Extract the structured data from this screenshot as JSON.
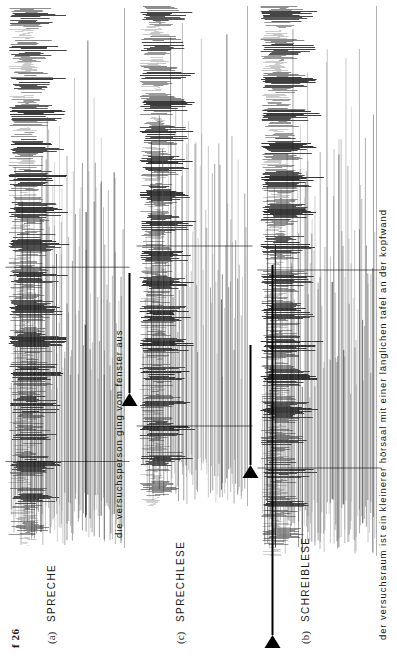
{
  "figure": {
    "label": "f 26",
    "width": 397,
    "height": 656
  },
  "panels": [
    {
      "tag": "(a)",
      "title": "SPRECHE",
      "caption": "die versuchsperson ging vom fenster aus",
      "marker": {
        "present": true,
        "glyph": "right-triangle"
      }
    },
    {
      "tag": "(c)",
      "title": "SPRECHLESE",
      "caption": "",
      "marker": {
        "present": true,
        "glyph": "right-triangle"
      }
    },
    {
      "tag": "(b)",
      "title": "SCHREIBLESE",
      "caption": "der versuchsraum ist ein kleinerer hörsaal mit einer länglichen tafel an der kopfwand",
      "marker": {
        "present": true,
        "glyph": "right-triangle"
      }
    }
  ],
  "colors": {
    "ink": "#000000",
    "paper": "#ffffff",
    "trace_dark": "#1b1b1b",
    "trace_mid": "#555555",
    "trace_light": "#9a9a9a"
  },
  "chart_data": {
    "type": "line",
    "title": "f 26",
    "xlabel": "",
    "ylabel": "",
    "grid": false,
    "legend": "none",
    "series": [
      {
        "name": "SPRECHE",
        "panel": "(a)",
        "annotation": "die versuchsperson ging vom fenster aus",
        "x": [
          0,
          1,
          2,
          3,
          4,
          5,
          6,
          7,
          8,
          9,
          10,
          11,
          12,
          13,
          14,
          15,
          16,
          17,
          18,
          19,
          20,
          21,
          22,
          23,
          24,
          25,
          26,
          27,
          28,
          29,
          30,
          31,
          32,
          33,
          34,
          35,
          36,
          37,
          38,
          39,
          40,
          41,
          42,
          43,
          44,
          45,
          46,
          47,
          48,
          49,
          50,
          51,
          52,
          53,
          54,
          55,
          56,
          57,
          58,
          59,
          60,
          61,
          62,
          63,
          64,
          65,
          66,
          67,
          68,
          69,
          70,
          71,
          72,
          73,
          74,
          75,
          76,
          77,
          78,
          79,
          80,
          81,
          82,
          83,
          84,
          85,
          86,
          87,
          88,
          89,
          90,
          91,
          92,
          93,
          94,
          95,
          96,
          97,
          98,
          99
        ],
        "values": [
          12,
          30,
          64,
          88,
          72,
          40,
          22,
          55,
          95,
          120,
          86,
          48,
          28,
          62,
          104,
          130,
          96,
          52,
          30,
          70,
          112,
          90,
          58,
          34,
          76,
          118,
          140,
          100,
          60,
          36,
          80,
          124,
          150,
          108,
          64,
          38,
          84,
          128,
          146,
          102,
          58,
          32,
          74,
          116,
          138,
          96,
          54,
          30,
          68,
          110,
          132,
          92,
          50,
          28,
          66,
          108,
          136,
          98,
          56,
          32,
          72,
          114,
          142,
          104,
          62,
          36,
          78,
          120,
          148,
          106,
          60,
          34,
          76,
          118,
          144,
          100,
          56,
          30,
          70,
          112,
          138,
          94,
          52,
          28,
          64,
          106,
          134,
          90,
          48,
          26,
          60,
          102,
          128,
          86,
          44,
          24,
          56,
          98,
          124,
          80
        ]
      },
      {
        "name": "SPRECHLESE",
        "panel": "(c)",
        "annotation": "",
        "x": [
          0,
          1,
          2,
          3,
          4,
          5,
          6,
          7,
          8,
          9,
          10,
          11,
          12,
          13,
          14,
          15,
          16,
          17,
          18,
          19,
          20,
          21,
          22,
          23,
          24,
          25,
          26,
          27,
          28,
          29,
          30,
          31,
          32,
          33,
          34,
          35,
          36,
          37,
          38,
          39,
          40,
          41,
          42,
          43,
          44,
          45,
          46,
          47,
          48,
          49,
          50,
          51,
          52,
          53,
          54,
          55,
          56,
          57,
          58,
          59,
          60,
          61,
          62,
          63,
          64,
          65,
          66,
          67,
          68,
          69,
          70,
          71,
          72,
          73,
          74,
          75,
          76,
          77,
          78,
          79,
          80,
          81,
          82,
          83,
          84,
          85,
          86,
          87,
          88,
          89,
          90,
          91,
          92,
          93,
          94,
          95,
          96,
          97,
          98,
          99
        ],
        "values": [
          8,
          20,
          44,
          66,
          52,
          28,
          16,
          38,
          70,
          92,
          64,
          34,
          20,
          46,
          80,
          98,
          70,
          38,
          22,
          50,
          84,
          66,
          42,
          24,
          54,
          88,
          104,
          74,
          44,
          26,
          58,
          92,
          110,
          78,
          46,
          28,
          60,
          96,
          108,
          76,
          42,
          24,
          54,
          86,
          102,
          70,
          40,
          22,
          50,
          82,
          100,
          68,
          36,
          20,
          48,
          80,
          98,
          72,
          40,
          24,
          52,
          84,
          104,
          76,
          44,
          26,
          56,
          88,
          106,
          78,
          42,
          24,
          54,
          86,
          102,
          72,
          40,
          22,
          50,
          82,
          100,
          68,
          38,
          20,
          46,
          78,
          96,
          64,
          34,
          18,
          44,
          74,
          94,
          62,
          32,
          16,
          40,
          70,
          90,
          58
        ]
      },
      {
        "name": "SCHREIBLESE",
        "panel": "(b)",
        "annotation": "der versuchsraum ist ein kleinerer hörsaal mit einer länglichen tafel an der kopfwand",
        "x": [
          0,
          1,
          2,
          3,
          4,
          5,
          6,
          7,
          8,
          9,
          10,
          11,
          12,
          13,
          14,
          15,
          16,
          17,
          18,
          19,
          20,
          21,
          22,
          23,
          24,
          25,
          26,
          27,
          28,
          29,
          30,
          31,
          32,
          33,
          34,
          35,
          36,
          37,
          38,
          39,
          40,
          41,
          42,
          43,
          44,
          45,
          46,
          47,
          48,
          49,
          50,
          51,
          52,
          53,
          54,
          55,
          56,
          57,
          58,
          59,
          60,
          61,
          62,
          63,
          64,
          65,
          66,
          67,
          68,
          69,
          70,
          71,
          72,
          73,
          74,
          75,
          76,
          77,
          78,
          79,
          80,
          81,
          82,
          83,
          84,
          85,
          86,
          87,
          88,
          89,
          90,
          91,
          92,
          93,
          94,
          95,
          96,
          97,
          98,
          99
        ],
        "values": [
          10,
          26,
          58,
          84,
          68,
          36,
          20,
          50,
          88,
          114,
          80,
          44,
          26,
          58,
          98,
          124,
          90,
          48,
          28,
          66,
          106,
          84,
          54,
          32,
          70,
          112,
          134,
          94,
          56,
          34,
          76,
          118,
          144,
          102,
          60,
          36,
          80,
          122,
          140,
          96,
          54,
          30,
          70,
          110,
          132,
          90,
          50,
          28,
          64,
          104,
          126,
          86,
          46,
          26,
          62,
          102,
          130,
          92,
          52,
          30,
          68,
          108,
          136,
          98,
          58,
          34,
          72,
          114,
          142,
          100,
          56,
          32,
          72,
          112,
          138,
          94,
          52,
          28,
          66,
          106,
          132,
          88,
          48,
          26,
          60,
          100,
          128,
          84,
          44,
          24,
          56,
          96,
          122,
          80,
          40,
          22,
          52,
          92,
          118,
          74
        ]
      }
    ]
  }
}
